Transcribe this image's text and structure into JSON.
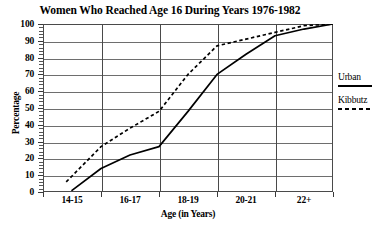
{
  "chart_data": {
    "type": "line",
    "title": "Women Who Reached Age 16 During Years 1976-1982",
    "xlabel": "Age (in Years)",
    "ylabel": "Percentage",
    "categories": [
      "14-15",
      "16-17",
      "18-19",
      "20-21",
      "22+"
    ],
    "xtick_labels": [
      "14-15",
      "16-17",
      "18-19",
      "20-21",
      "22+"
    ],
    "ytick_labels": [
      "0",
      "10",
      "20",
      "30",
      "40",
      "50",
      "60",
      "70",
      "80",
      "90",
      "100"
    ],
    "ytick_values": [
      0,
      10,
      20,
      30,
      40,
      50,
      60,
      70,
      80,
      90,
      100
    ],
    "ylim": [
      0,
      100
    ],
    "grid": "horizontal-and-vertical",
    "legend_position": "right",
    "series": [
      {
        "name": "Urban",
        "style": "solid",
        "color": "#000000",
        "points": [
          {
            "x": 0.5,
            "y": 1
          },
          {
            "x": 1.0,
            "y": 14
          },
          {
            "x": 1.5,
            "y": 22
          },
          {
            "x": 2.0,
            "y": 27
          },
          {
            "x": 2.5,
            "y": 48
          },
          {
            "x": 3.0,
            "y": 70
          },
          {
            "x": 3.5,
            "y": 82
          },
          {
            "x": 4.0,
            "y": 93
          },
          {
            "x": 4.5,
            "y": 97
          },
          {
            "x": 5.0,
            "y": 100
          }
        ]
      },
      {
        "name": "Kibbutz",
        "style": "dashed",
        "color": "#000000",
        "points": [
          {
            "x": 0.4,
            "y": 6
          },
          {
            "x": 1.0,
            "y": 27
          },
          {
            "x": 1.5,
            "y": 38
          },
          {
            "x": 2.0,
            "y": 48
          },
          {
            "x": 2.5,
            "y": 70
          },
          {
            "x": 3.0,
            "y": 87
          },
          {
            "x": 3.5,
            "y": 91
          },
          {
            "x": 4.0,
            "y": 95
          },
          {
            "x": 4.5,
            "y": 99
          },
          {
            "x": 5.0,
            "y": 100
          }
        ]
      }
    ],
    "legend": [
      {
        "label": "Urban",
        "style": "solid"
      },
      {
        "label": "Kibbutz",
        "style": "dashed"
      }
    ]
  }
}
